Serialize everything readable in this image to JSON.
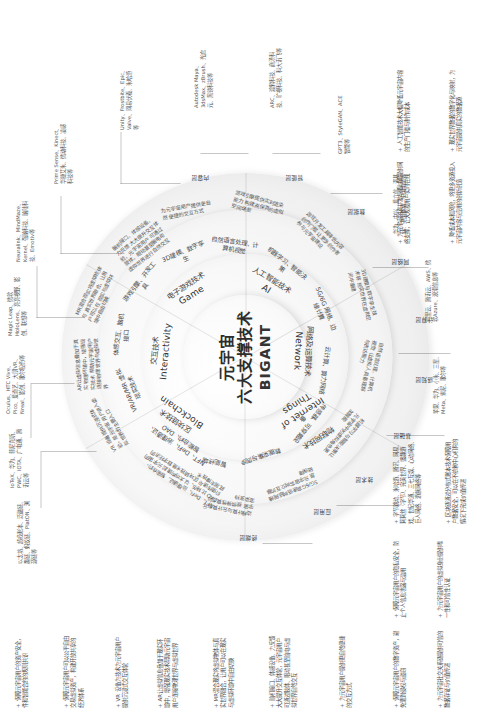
{
  "diagram": {
    "center": {
      "line1": "元宇宙",
      "line2": "六大支撑技术",
      "line3": "BIGANT"
    },
    "pillars": [
      {
        "cn": "区块链技术",
        "en": "Blockchain"
      },
      {
        "cn": "交互技术",
        "en": "Interactivity"
      },
      {
        "cn": "电子游戏技术",
        "en": "Game"
      },
      {
        "cn": "人工智能技术",
        "en": "AI"
      },
      {
        "cn": "网络及运算技术",
        "en": "Network"
      },
      {
        "cn": "物联网技术",
        "en": "Internet of\nThings"
      }
    ],
    "subdomains": [
      "NFT、DeFi、治理通证、智能合约、DAO",
      "VR/AR/MR 虚拟现实技术",
      "体感交互、脑机接口",
      "游戏引擎、开发工具",
      "3D建模、数字孪生",
      "自然语言处理、计算机视觉",
      "机器学习、智能决策",
      "5G/6G 网络、边缘计算",
      "云计算、算力网络",
      "传感器、可穿戴设备",
      "数据采集与同步",
      "智能终端"
    ],
    "ringLabels": [
      "应用层",
      "技术层",
      "基础层",
      "感知层",
      "计算层",
      "网络层",
      "数据层",
      "智能层",
      "内容层",
      "终端层"
    ],
    "descBlocks": [
      "NFT、DeFi、治理通证、智能合约、DAO 比特币、以太坊构建起 元宇宙的价值传递与 区块链技术是数字经济的底层支撑技术",
      "VR 设备提供沉浸式体验，是元宇宙 用户进入虚拟世界的主要入口",
      "AR让虚拟信息叠加于真实 物理环境中，增强现实技术 帮助元宇宙用户连接物理 世界与虚拟世界",
      "MR混合现实将虚拟物体与 真实世界融合，让用户可以在 现实与虚拟环境中自由切换",
      "脑机接口、体感设备、力反馈 大大提升交互体验，元宇宙用户 可通过肢体、眼动甚至脑电与 虚拟世界进行自然交互",
      "为元宇宙用户提供更自然 便捷的交互方式",
      "游戏引擎提供实时渲染能力 构建高保真的虚拟空间场景",
      "游戏开发工具降低内容创作门槛 让更多创作者参与元宇宙建设",
      "3D建模与数字孪生技术将 现实世界在虚拟空间中重建",
      "自然语言处理、计算机视觉 让虚拟人具备理解与表达能力",
      "机器学习与智能决策让 元宇宙中的虚拟角色更加智能",
      "5G/6G高速低时延网络是 元宇宙实时交互的基础保障",
      "边缘计算与云计算为元宇宙 提供弹性算力与渲染支持",
      "传感器与可穿戴设备采集 用户与环境的真实数据",
      "物联网将现实世界海量设备 接入元宇宙，实现虚实互联",
      "智能终端是用户进入 元宇宙的载体与入口"
    ],
    "callouts": [
      {
        "text": "以太坊、超级账本、泛融链、趣链、蚂蚁链、PlatON、溯源链等"
      },
      {
        "text": "IoTeX、华为、菲尼克斯、PWC、IOTA、广电通、腾讯云等"
      },
      {
        "text": "Oculus、HTC Vive、Pico、爱奇艺、大朋VR、Nreal、影创、歌尔股份等"
      },
      {
        "text": "Magic Leap、微软HoloLens、亮亮视野、影创、联想等"
      },
      {
        "text": "Neuralink、MindMaze、Kernel、强脑科技、脑陆科技、Emotiv等"
      },
      {
        "text": "Prime Sense、Kinect、华捷艾米、微动科技、凌感科技等"
      },
      {
        "text": "Unity、Frostbite、Epic、Valve、网易伏羲、米哈游等"
      },
      {
        "text": "Autodesk Maya、3dsMax、zBrush、光启元、黑镜科技等"
      },
      {
        "text": "ARC、渡鸦科技、商汤科技、旷视科技、科大讯飞等"
      },
      {
        "text": "GPT3、StyleGAN、ACE智能等"
      },
      {
        "text": "华为、中兴、爱立信、诺基亚、中国移动、中国电信等"
      },
      {
        "text": "阿里云、腾讯云、AWS、微软Azure、浪潮信息等"
      },
      {
        "text": "苹果、华为、小米、三星、Meta、索尼、歌尔等"
      }
    ],
    "leftNotes": [
      "保障元宇宙用户的资产安全，件和智能合约的规则共识",
      "保障元宇宙用户可以公平自由交易虚拟资产，构建开放共享的经济体系",
      "VR 设备为技术为元宇宙用户提供沉浸式交互体验",
      "AR让虚拟信息叠加于现实环境中，增强现实技术帮助元宇宙用户连接物理世界与虚拟世界",
      "MR混合现实将虚拟物体与真实世界融合，让用户可以在现实与虚拟环境中自由切换",
      "脑机接口、体感设备、力反馈大大提升交互体验，元宇宙用户可通过肢体、眼动甚至脑电与虚拟世界自然交互",
      "为元宇宙用户提供更自然便捷的交互方式"
    ],
    "bottomNotes": [
      "保障元宇宙用户的数字资产，避免遭到侵权与盗窃",
      "保障元宇宙用户的隐私安全，防止个人信息泄露与滥用",
      "为元宇宙社交关系链提供可信的数据存证与价值传递",
      "为元宇宙用户的虚拟身份提供唯一性和可信性认证",
      "字节跳动、米哈游、腾讯、网易、莉莉丝（字节）、完美世界、盛趣游戏、世纪华通、三七互娱、心动网络、巨人网络、游族网络等",
      "区块链通过分布式账本技术保障用户数据安全，可以在不依赖中心机构的情况下完成价值传递",
      "降低成本和风险，将更多资源投入元宇宙内容与应用的创新创造",
      "现实世界数据的数字化与映射，为元宇宙提供真实的数据源",
      "为元宇宙的高并发与低时延提供网络支撑，让大规模用户实时在线",
      "人工智能技术大幅降低元宇宙内容的生产门槛与制作成本"
    ]
  }
}
